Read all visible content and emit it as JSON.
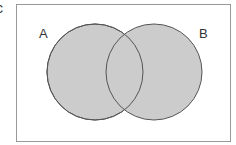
{
  "figure": {
    "cut_label": "c",
    "sets": [
      {
        "name": "A",
        "fill": "#cccccc",
        "stroke": "#555555"
      },
      {
        "name": "B",
        "fill": "#cccccc",
        "stroke": "#555555"
      }
    ],
    "frame_color": "#999999",
    "background": "#ffffff"
  }
}
